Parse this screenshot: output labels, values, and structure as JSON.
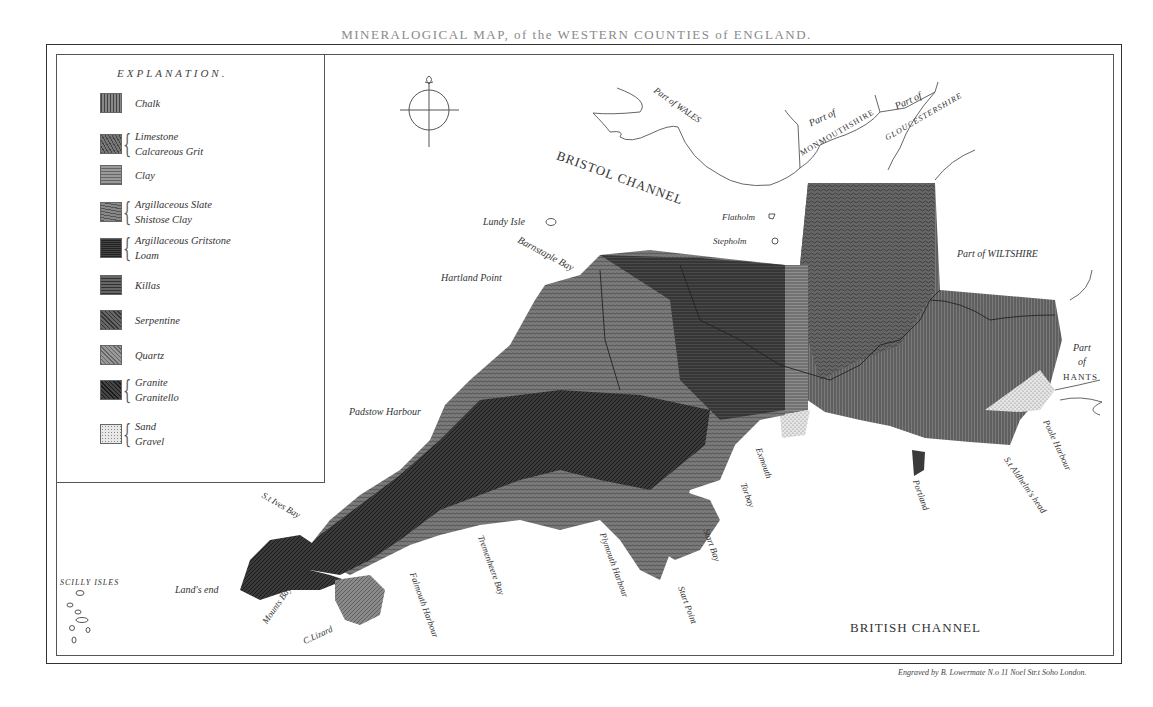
{
  "title": "MINERALOGICAL MAP, of the WESTERN COUNTIES of ENGLAND.",
  "legend": {
    "heading": "EXPLANATION.",
    "items": [
      {
        "labels": [
          "Chalk"
        ],
        "color": "#6e6e6e",
        "pattern": "vertical"
      },
      {
        "labels": [
          "Limestone",
          "Calcareous Grit"
        ],
        "color": "#5c5c5c",
        "pattern": "wavy"
      },
      {
        "labels": [
          "Clay"
        ],
        "color": "#8a8a8a",
        "pattern": "horizontal"
      },
      {
        "labels": [
          "Argillaceous Slate",
          "Shistose Clay"
        ],
        "color": "#6a6a6a",
        "pattern": "mixed"
      },
      {
        "labels": [
          "Argillaceous Gritstone",
          "Loam"
        ],
        "color": "#3c3c3c",
        "pattern": "dense"
      },
      {
        "labels": [
          "Killas"
        ],
        "color": "#4e4e4e",
        "pattern": "horizontal"
      },
      {
        "labels": [
          "Serpentine"
        ],
        "color": "#505050",
        "pattern": "diagonal"
      },
      {
        "labels": [
          "Quartz"
        ],
        "color": "#7a7a7a",
        "pattern": "diagonal"
      },
      {
        "labels": [
          "Granite",
          "Granitello"
        ],
        "color": "#333333",
        "pattern": "diagonal"
      },
      {
        "labels": [
          "Sand",
          "Gravel"
        ],
        "color": "#cfcfcf",
        "pattern": "dotted"
      }
    ]
  },
  "places": {
    "bristol_channel": "BRISTOL CHANNEL",
    "british_channel": "BRITISH CHANNEL",
    "wales": "Part of WALES",
    "monmouth_1": "Part of",
    "monmouth_2": "MONMOUTHSHIRE",
    "glouc_1": "Part of",
    "glouc_2": "GLOUCESTERSHIRE",
    "wiltshire": "Part of WILTSHIRE",
    "hants_1": "Part",
    "hants_2": "of",
    "hants_3": "HANTS",
    "lundy": "Lundy Isle",
    "flatholm": "Flatholm",
    "stepholm": "Stepholm",
    "barnstaple": "Barnstaple Bay",
    "hartland": "Hartland Point",
    "padstow": "Padstow Harbour",
    "st_ives": "S.t Ives Bay",
    "lands_end": "Land's end",
    "scilly": "SCILLY ISLES",
    "mounts_bay": "Mounts Bay",
    "lizard": "C.Lizard",
    "falmouth": "Falmouth Harbour",
    "tremenheere": "Tremenheere Bay",
    "plymouth": "Plymouth Harbour",
    "start_point": "Start Point",
    "start_bay": "Start Bay",
    "torbay": "Torbay",
    "exmouth": "Exmouth",
    "portland": "Portland",
    "st_aldhelms": "S.t Aldhelm's head",
    "poole": "Poole Harbour"
  },
  "credit": "Engraved by B. Lowermate N.o 11 Noel Str.t Soho London."
}
